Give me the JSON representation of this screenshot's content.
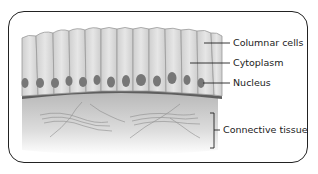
{
  "diagram": {
    "labels": [
      {
        "id": "columnar-cells",
        "text": "Columnar cells",
        "x": 233,
        "y": 38
      },
      {
        "id": "cytoplasm",
        "text": "Cytoplasm",
        "x": 233,
        "y": 58
      },
      {
        "id": "nucleus",
        "text": "Nucleus",
        "x": 233,
        "y": 78
      },
      {
        "id": "connective-tissue",
        "text": "Connective tissue",
        "x": 223,
        "y": 125
      }
    ],
    "colors": {
      "cell_fill": "#d9d9d9",
      "cell_border": "#9a9a9a",
      "nucleus": "#777777",
      "basement": "#5e5e5e",
      "tissue_top": "#bdbdbd",
      "tissue_bottom": "#ffffff",
      "frame": "#222222"
    }
  }
}
